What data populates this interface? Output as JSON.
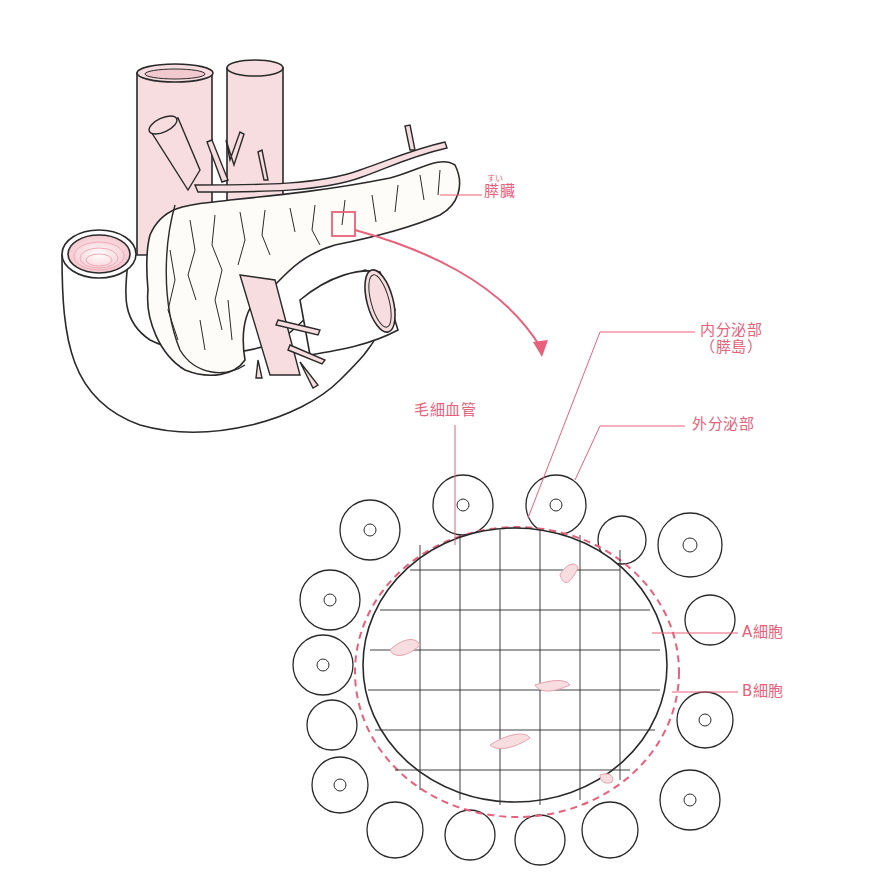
{
  "diagram": {
    "type": "anatomical-illustration",
    "accent_color": "#e8607a",
    "line_color": "#2a2a2a",
    "tissue_fill": "#fdfcf8",
    "vessel_fill": "#f7dde0",
    "labels": {
      "pancreas": {
        "text": "膵臓",
        "ruby": "すい"
      },
      "endocrine": {
        "line1": "内分泌部",
        "line2": "（膵島）"
      },
      "capillary": {
        "text": "毛細血管"
      },
      "exocrine": {
        "text": "外分泌部"
      },
      "a_cell": {
        "text": "A細胞"
      },
      "b_cell": {
        "text": "B細胞"
      }
    },
    "callout": {
      "from": "pancreas-body-magnify-box",
      "to": "islet-micrograph"
    }
  }
}
